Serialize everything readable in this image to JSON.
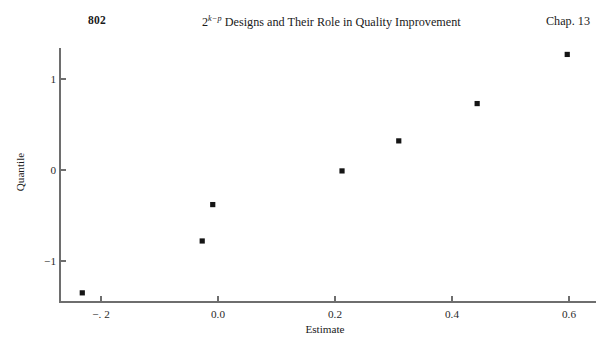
{
  "header": {
    "page_number": "802",
    "running_head_prefix": "2",
    "running_head_superscript": "k−p",
    "running_head_rest": " Designs and Their Role in Quality Improvement",
    "chapter_label": "Chap. 13"
  },
  "chart_data": {
    "type": "scatter",
    "title": "",
    "xlabel": "Estimate",
    "ylabel": "Quantile",
    "xlim": [
      -0.28,
      0.63
    ],
    "ylim": [
      -1.52,
      1.42
    ],
    "grid": false,
    "legend": "none",
    "xticks": [
      -0.2,
      0.0,
      0.2,
      0.4,
      0.6
    ],
    "xticklabels": [
      "−. 2",
      "0.0",
      "0.2",
      "0.4",
      "0.6"
    ],
    "yticks": [
      1,
      0,
      -1
    ],
    "yticklabels": [
      "1",
      "0",
      "−1"
    ],
    "marker": "square",
    "marker_color": "#151515",
    "axis_color": "#6e6e6e",
    "points": [
      {
        "x": -0.232,
        "y": -1.35
      },
      {
        "x": -0.027,
        "y": -0.78
      },
      {
        "x": -0.009,
        "y": -0.38
      },
      {
        "x": 0.212,
        "y": -0.01
      },
      {
        "x": 0.309,
        "y": 0.32
      },
      {
        "x": 0.443,
        "y": 0.73
      },
      {
        "x": 0.597,
        "y": 1.27
      }
    ]
  }
}
